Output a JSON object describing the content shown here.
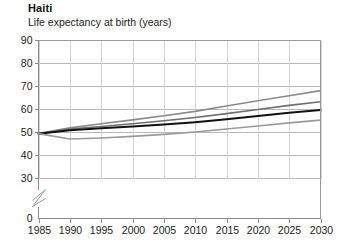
{
  "chart_data": {
    "type": "line",
    "title": "Haiti",
    "subtitle": "Life expectancy at birth (years)",
    "xlabel": "",
    "ylabel": "",
    "xlim": [
      1985,
      2030
    ],
    "ylim": [
      30,
      90
    ],
    "y_axis_broken_at": 0,
    "grid": true,
    "legend": "none",
    "x_ticks": [
      1985,
      1990,
      1995,
      2000,
      2005,
      2010,
      2015,
      2020,
      2025,
      2030
    ],
    "y_ticks": [
      0,
      30,
      40,
      50,
      60,
      70,
      80,
      90
    ],
    "x": [
      1985,
      1990,
      1995,
      2000,
      2005,
      2010,
      2015,
      2020,
      2025,
      2030
    ],
    "series": [
      {
        "name": "high-variant",
        "color": "#8a8a8a",
        "width": 1.6,
        "values": [
          49.5,
          52.0,
          53.8,
          55.5,
          57.3,
          59.2,
          61.5,
          63.8,
          66.0,
          68.2
        ]
      },
      {
        "name": "medium-variant",
        "color": "#6f6f6f",
        "width": 1.6,
        "values": [
          49.5,
          51.5,
          52.6,
          53.8,
          55.1,
          56.5,
          58.2,
          60.0,
          61.8,
          63.4
        ]
      },
      {
        "name": "estimate",
        "color": "#111111",
        "width": 2.0,
        "values": [
          49.5,
          51.0,
          51.8,
          52.6,
          53.5,
          54.5,
          55.8,
          57.2,
          58.6,
          59.8
        ]
      },
      {
        "name": "low-variant",
        "color": "#9a9a9a",
        "width": 1.6,
        "values": [
          49.5,
          47.2,
          47.6,
          48.3,
          49.2,
          50.2,
          51.5,
          52.8,
          54.2,
          55.4
        ]
      }
    ]
  },
  "axis_labels": {
    "x": [
      "1985",
      "1990",
      "1995",
      "2000",
      "2005",
      "2010",
      "2015",
      "2020",
      "2025",
      "2030"
    ],
    "y": [
      "90",
      "80",
      "70",
      "60",
      "50",
      "40",
      "30",
      "0"
    ]
  }
}
